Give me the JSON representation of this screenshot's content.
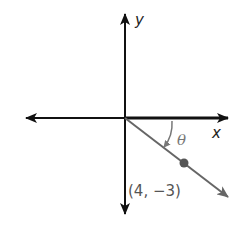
{
  "diagram": {
    "type": "coordinate-plane-angle",
    "labels": {
      "x_axis": "x",
      "y_axis": "y",
      "angle": "θ",
      "point": "(4, −3)"
    },
    "point": {
      "x": 4,
      "y": -3
    },
    "colors": {
      "axes": "#111111",
      "ray": "#666666",
      "point": "#555555",
      "angle_arc": "#777777"
    }
  }
}
